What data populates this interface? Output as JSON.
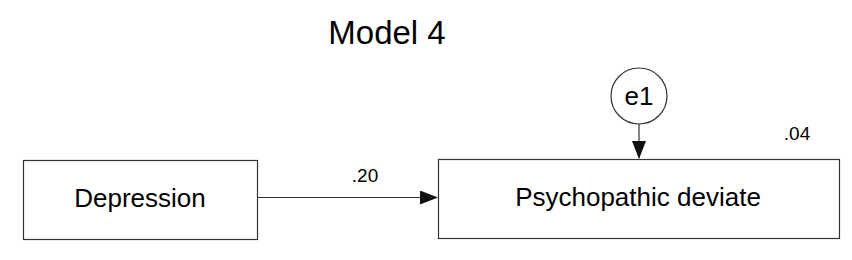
{
  "title": "Model 4",
  "nodes": {
    "exogenous": {
      "label": "Depression"
    },
    "endogenous": {
      "label": "Psychopathic deviate",
      "r_squared": ".04"
    },
    "error": {
      "label": "e1"
    }
  },
  "paths": [
    {
      "from": "Depression",
      "to": "Psychopathic deviate",
      "coefficient": ".20"
    },
    {
      "from": "e1",
      "to": "Psychopathic deviate",
      "coefficient": ""
    }
  ]
}
